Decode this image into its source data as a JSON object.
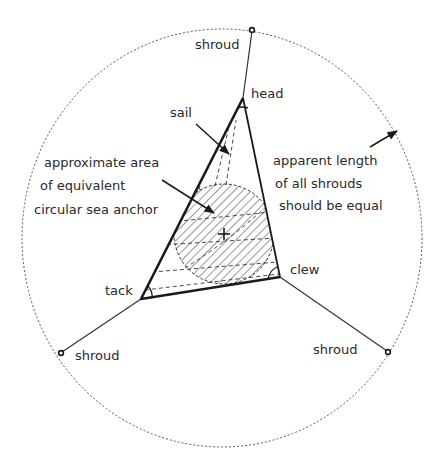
{
  "diagram": {
    "labels": {
      "shroud_top": "shroud",
      "shroud_left": "shroud",
      "shroud_right": "shroud",
      "head": "head",
      "tack": "tack",
      "clew": "clew",
      "sail": "sail",
      "area_line1": "approximate area",
      "area_line2": "of equivalent",
      "area_line3": "circular sea anchor",
      "length_line1": "apparent length",
      "length_line2": "of all shrouds",
      "length_line3": "should be equal"
    },
    "points": {
      "head": [
        243,
        98
      ],
      "tack": [
        141,
        299
      ],
      "clew": [
        280,
        277
      ],
      "shroud_top_anchor": [
        252,
        30
      ],
      "shroud_left_anchor": [
        61,
        353
      ],
      "shroud_right_anchor": [
        388,
        352
      ],
      "anchor_center": [
        224,
        234
      ]
    },
    "outline_circle": {
      "cx": 222,
      "cy": 238,
      "rx": 200,
      "ry": 209
    },
    "anchor_circle_radius": 50,
    "colors": {
      "ink": "#1a1a1a",
      "background": "#ffffff"
    }
  }
}
